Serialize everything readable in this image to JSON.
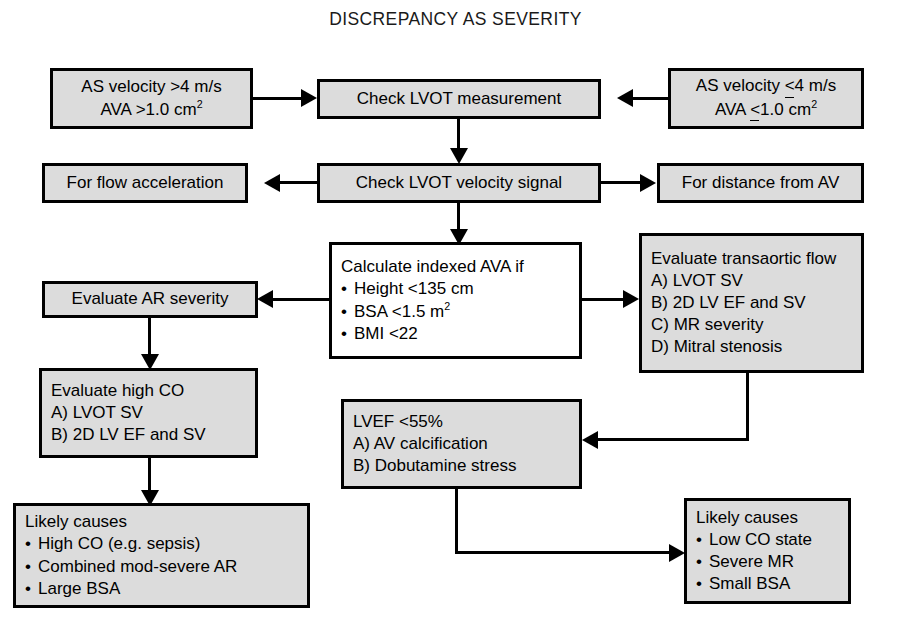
{
  "diagram": {
    "title": "DISCREPANCY AS SEVERITY",
    "colors": {
      "box_fill": "#dcdcdc",
      "box_fill_alt": "#ffffff",
      "border": "#000000",
      "background": "#ffffff",
      "text": "#000000"
    }
  },
  "nodes": {
    "as_velocity_high": {
      "line1_a": "AS velocity >4 m/s",
      "line2_a": "AVA >1.0 cm",
      "line2_sup": "2"
    },
    "check_lvot_measurement": {
      "label": "Check LVOT measurement"
    },
    "as_velocity_low": {
      "line1_a": "AS velocity ",
      "line1_lte": "<",
      "line1_b": "4 m/s",
      "line2_a": "AVA ",
      "line2_lte": "<",
      "line2_b": "1.0 cm",
      "line2_sup": "2"
    },
    "for_flow_acceleration": {
      "label": "For flow acceleration"
    },
    "check_lvot_velocity_signal": {
      "label": "Check LVOT velocity signal"
    },
    "for_distance_from_av": {
      "label": "For distance from AV"
    },
    "calculate_indexed_ava": {
      "heading": "Calculate indexed AVA if",
      "items": [
        {
          "text_a": "Height <135 cm",
          "sup": ""
        },
        {
          "text_a": "BSA <1.5 m",
          "sup": "2"
        },
        {
          "text_a": "BMI <22",
          "sup": ""
        }
      ]
    },
    "evaluate_transaortic_flow": {
      "heading": "Evaluate transaortic flow",
      "items": [
        "A) LVOT SV",
        "B) 2D LV EF and SV",
        "C) MR severity",
        "D) Mitral stenosis"
      ]
    },
    "evaluate_ar_severity": {
      "label": "Evaluate AR severity"
    },
    "evaluate_high_co": {
      "heading": "Evaluate high CO",
      "items": [
        "A) LVOT SV",
        "B) 2D LV EF and SV"
      ]
    },
    "lvef_low": {
      "heading": "LVEF <55%",
      "items": [
        "A) AV calcification",
        "B) Dobutamine stress"
      ]
    },
    "likely_causes_high": {
      "heading": "Likely causes",
      "items": [
        "High CO (e.g. sepsis)",
        "Combined mod-severe AR",
        "Large BSA"
      ]
    },
    "likely_causes_low": {
      "heading": "Likely causes",
      "items": [
        "Low CO state",
        "Severe MR",
        "Small BSA"
      ]
    }
  }
}
